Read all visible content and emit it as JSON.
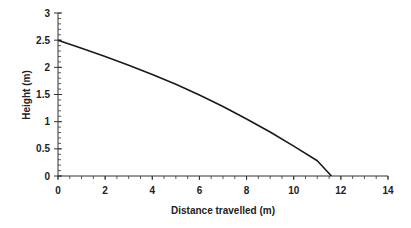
{
  "chart_data": {
    "type": "line",
    "title": "",
    "xlabel": "Distance travelled (m)",
    "ylabel": "Height (m)",
    "xlim": [
      0,
      14
    ],
    "ylim": [
      0,
      3
    ],
    "x_ticks": [
      0,
      2,
      4,
      6,
      8,
      10,
      12,
      14
    ],
    "x_tick_labels": [
      "0",
      "2",
      "4",
      "6",
      "8",
      "10",
      "12",
      "14"
    ],
    "y_ticks": [
      0,
      0.5,
      1,
      1.5,
      2,
      2.5,
      3
    ],
    "y_tick_labels": [
      "0",
      "0.5",
      "1",
      "1.5",
      "2",
      "2.5",
      "3"
    ],
    "x_minor_step": 0.5,
    "y_minor_step": 0.1,
    "grid": false,
    "legend": null,
    "series": [
      {
        "name": "Trajectory",
        "color": "#1a1a1a",
        "x": [
          0,
          1,
          2,
          3,
          4,
          5,
          6,
          7,
          8,
          9,
          10,
          11,
          11.6
        ],
        "y": [
          2.5,
          2.35,
          2.2,
          2.04,
          1.87,
          1.69,
          1.49,
          1.28,
          1.05,
          0.81,
          0.55,
          0.28,
          0
        ]
      }
    ]
  },
  "colors": {
    "axis": "#333333",
    "line": "#1a1a1a",
    "text": "#222222",
    "background": "#ffffff"
  }
}
